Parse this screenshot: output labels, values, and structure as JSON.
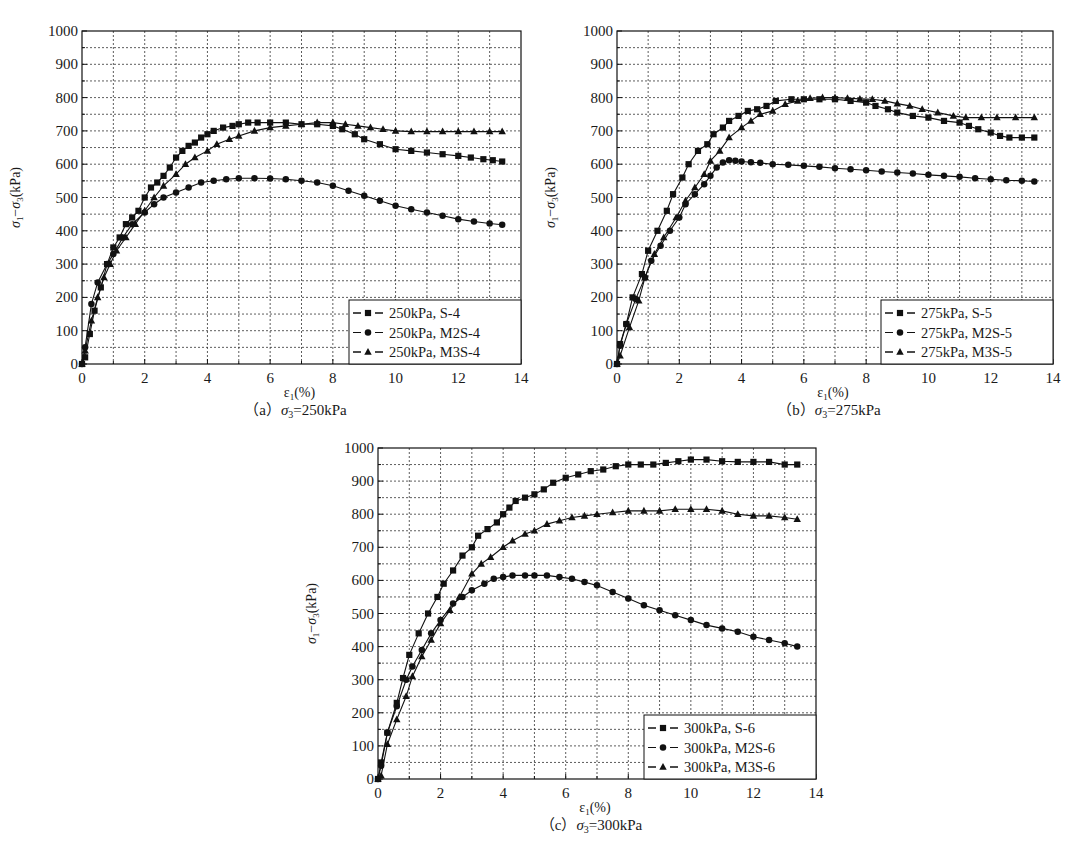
{
  "chart_data": [
    {
      "id": "a",
      "type": "line",
      "caption": "(a) σ3=250kPa",
      "caption_prefix": "（a）",
      "caption_sigma": "σ",
      "caption_sub": "3",
      "caption_rest": "=250kPa",
      "xlabel": "ε1(%)",
      "ylabel": "σ1−σ3 (kPa)",
      "xlim": [
        0,
        14
      ],
      "ylim": [
        0,
        1000
      ],
      "xticks": [
        0,
        2,
        4,
        6,
        8,
        10,
        12,
        14
      ],
      "yticks": [
        0,
        100,
        200,
        300,
        400,
        500,
        600,
        700,
        800,
        900,
        1000
      ],
      "grid": true,
      "legend_position": "lower right",
      "series": [
        {
          "name": "250kPa, S-4",
          "marker": "square",
          "x": [
            0,
            0.1,
            0.25,
            0.4,
            0.6,
            0.8,
            1.0,
            1.2,
            1.4,
            1.6,
            1.8,
            2.0,
            2.2,
            2.4,
            2.6,
            2.8,
            3.0,
            3.2,
            3.4,
            3.6,
            3.8,
            4.0,
            4.2,
            4.5,
            4.8,
            5.0,
            5.3,
            5.6,
            6.0,
            6.5,
            7.0,
            7.5,
            8.0,
            8.3,
            8.7,
            9.0,
            9.5,
            10.0,
            10.5,
            11.0,
            11.5,
            12.0,
            12.4,
            12.8,
            13.1,
            13.4
          ],
          "y": [
            0,
            20,
            90,
            160,
            230,
            300,
            350,
            380,
            420,
            440,
            460,
            500,
            530,
            545,
            565,
            590,
            620,
            640,
            655,
            665,
            680,
            690,
            700,
            710,
            715,
            720,
            725,
            725,
            725,
            725,
            720,
            720,
            715,
            705,
            690,
            675,
            660,
            645,
            640,
            635,
            630,
            625,
            620,
            615,
            612,
            608
          ]
        },
        {
          "name": "250kPa, M2S-4",
          "marker": "circle",
          "x": [
            0,
            0.1,
            0.3,
            0.5,
            0.8,
            1.0,
            1.3,
            1.6,
            2.0,
            2.3,
            2.6,
            3.0,
            3.4,
            3.8,
            4.2,
            4.6,
            5.0,
            5.5,
            6.0,
            6.5,
            7.0,
            7.5,
            8.0,
            8.5,
            9.0,
            9.5,
            10.0,
            10.5,
            11.0,
            11.5,
            12.0,
            12.5,
            13.0,
            13.4
          ],
          "y": [
            0,
            50,
            180,
            245,
            300,
            330,
            380,
            420,
            455,
            480,
            500,
            515,
            530,
            545,
            550,
            555,
            558,
            558,
            557,
            555,
            550,
            545,
            535,
            520,
            505,
            490,
            475,
            465,
            455,
            445,
            435,
            428,
            422,
            418
          ]
        },
        {
          "name": "250kPa, M3S-4",
          "marker": "triangle",
          "x": [
            0,
            0.1,
            0.3,
            0.5,
            0.7,
            0.9,
            1.1,
            1.4,
            1.7,
            2.0,
            2.3,
            2.6,
            3.0,
            3.3,
            3.6,
            4.0,
            4.3,
            4.7,
            5.0,
            5.5,
            6.0,
            6.5,
            7.0,
            7.5,
            8.0,
            8.4,
            8.8,
            9.2,
            9.6,
            10.0,
            10.5,
            11.0,
            11.5,
            12.0,
            12.5,
            13.0,
            13.4
          ],
          "y": [
            0,
            40,
            130,
            200,
            260,
            300,
            340,
            380,
            420,
            460,
            500,
            535,
            570,
            600,
            620,
            640,
            660,
            675,
            685,
            700,
            710,
            715,
            720,
            725,
            725,
            720,
            715,
            710,
            705,
            700,
            698,
            698,
            698,
            698,
            698,
            698,
            698
          ]
        }
      ]
    },
    {
      "id": "b",
      "type": "line",
      "caption": "(b) σ3=275kPa",
      "caption_prefix": "（b）",
      "caption_sigma": "σ",
      "caption_sub": "3",
      "caption_rest": "=275kPa",
      "xlabel": "ε1(%)",
      "ylabel": "σ1−σ3 (kPa)",
      "xlim": [
        0,
        14
      ],
      "ylim": [
        0,
        1000
      ],
      "xticks": [
        0,
        2,
        4,
        6,
        8,
        10,
        12,
        14
      ],
      "yticks": [
        0,
        100,
        200,
        300,
        400,
        500,
        600,
        700,
        800,
        900,
        1000
      ],
      "grid": true,
      "legend_position": "lower right",
      "series": [
        {
          "name": "275kPa, S-5",
          "marker": "square",
          "x": [
            0,
            0.1,
            0.3,
            0.5,
            0.8,
            1.0,
            1.3,
            1.6,
            1.8,
            2.1,
            2.3,
            2.6,
            2.9,
            3.1,
            3.4,
            3.6,
            3.9,
            4.2,
            4.5,
            4.8,
            5.1,
            5.6,
            6.0,
            6.5,
            7.0,
            7.5,
            8.0,
            8.3,
            8.7,
            9.0,
            9.5,
            10.0,
            10.5,
            11.0,
            11.3,
            11.6,
            12.0,
            12.3,
            12.6,
            13.0,
            13.4
          ],
          "y": [
            0,
            60,
            120,
            200,
            270,
            340,
            400,
            460,
            510,
            560,
            600,
            640,
            660,
            690,
            710,
            730,
            745,
            760,
            765,
            775,
            790,
            795,
            795,
            795,
            795,
            790,
            785,
            775,
            765,
            755,
            745,
            740,
            730,
            725,
            715,
            705,
            695,
            685,
            680,
            680,
            680
          ]
        },
        {
          "name": "275kPa, M2S-5",
          "marker": "circle",
          "x": [
            0,
            0.1,
            0.3,
            0.6,
            0.9,
            1.1,
            1.4,
            1.7,
            2.0,
            2.2,
            2.5,
            2.8,
            3.0,
            3.2,
            3.4,
            3.6,
            3.8,
            4.0,
            4.3,
            4.6,
            5.0,
            5.5,
            6.0,
            6.5,
            7.0,
            7.5,
            8.0,
            8.5,
            9.0,
            9.5,
            10.0,
            10.5,
            11.0,
            11.5,
            12.0,
            12.5,
            13.0,
            13.4
          ],
          "y": [
            0,
            55,
            120,
            195,
            260,
            310,
            355,
            400,
            440,
            480,
            510,
            540,
            565,
            590,
            605,
            612,
            610,
            608,
            606,
            604,
            600,
            598,
            595,
            592,
            588,
            585,
            582,
            578,
            575,
            572,
            568,
            565,
            562,
            558,
            555,
            552,
            550,
            548
          ]
        },
        {
          "name": "275kPa, M3S-5",
          "marker": "triangle",
          "x": [
            0,
            0.1,
            0.4,
            0.7,
            0.9,
            1.2,
            1.5,
            1.9,
            2.2,
            2.5,
            2.8,
            3.0,
            3.3,
            3.6,
            4.0,
            4.3,
            4.6,
            5.0,
            5.4,
            5.8,
            6.2,
            6.6,
            7.0,
            7.4,
            7.8,
            8.2,
            8.6,
            9.0,
            9.4,
            9.8,
            10.3,
            10.8,
            11.2,
            11.7,
            12.2,
            12.8,
            13.4
          ],
          "y": [
            0,
            25,
            110,
            190,
            260,
            330,
            380,
            440,
            490,
            530,
            570,
            610,
            640,
            680,
            710,
            730,
            750,
            760,
            780,
            790,
            798,
            800,
            800,
            798,
            796,
            795,
            790,
            782,
            775,
            765,
            755,
            745,
            740,
            740,
            740,
            740,
            740
          ]
        }
      ]
    },
    {
      "id": "c",
      "type": "line",
      "caption": "(c) σ3=300kPa",
      "caption_prefix": "（c）",
      "caption_sigma": "σ",
      "caption_sub": "3",
      "caption_rest": "=300kPa",
      "xlabel": "ε1(%)",
      "ylabel": "σ1−σ3 (kPa)",
      "xlim": [
        0,
        14
      ],
      "ylim": [
        0,
        1000
      ],
      "xticks": [
        0,
        2,
        4,
        6,
        8,
        10,
        12,
        14
      ],
      "yticks": [
        0,
        100,
        200,
        300,
        400,
        500,
        600,
        700,
        800,
        900,
        1000
      ],
      "grid": true,
      "legend_position": "lower right",
      "series": [
        {
          "name": "300kPa, S-6",
          "marker": "square",
          "x": [
            0,
            0.1,
            0.3,
            0.6,
            0.8,
            1.0,
            1.3,
            1.6,
            1.9,
            2.1,
            2.4,
            2.7,
            3.0,
            3.2,
            3.5,
            3.8,
            4.0,
            4.2,
            4.4,
            4.7,
            5.0,
            5.3,
            5.6,
            6.0,
            6.4,
            6.8,
            7.2,
            7.6,
            8.0,
            8.4,
            8.8,
            9.2,
            9.6,
            10.0,
            10.5,
            11.0,
            11.5,
            12.0,
            12.5,
            13.0,
            13.4
          ],
          "y": [
            0,
            50,
            140,
            230,
            305,
            375,
            440,
            500,
            550,
            590,
            630,
            675,
            700,
            735,
            755,
            775,
            800,
            820,
            840,
            850,
            860,
            875,
            895,
            910,
            920,
            930,
            935,
            945,
            950,
            950,
            950,
            955,
            960,
            965,
            965,
            960,
            958,
            958,
            958,
            950,
            950
          ]
        },
        {
          "name": "300kPa, M2S-6",
          "marker": "circle",
          "x": [
            0,
            0.1,
            0.3,
            0.6,
            0.9,
            1.1,
            1.4,
            1.7,
            2.0,
            2.4,
            2.7,
            3.0,
            3.4,
            3.7,
            4.0,
            4.3,
            4.7,
            5.0,
            5.4,
            5.8,
            6.2,
            6.6,
            7.0,
            7.5,
            8.0,
            8.5,
            9.0,
            9.5,
            10.0,
            10.5,
            11.0,
            11.5,
            12.0,
            12.5,
            13.0,
            13.4
          ],
          "y": [
            0,
            40,
            140,
            220,
            300,
            340,
            390,
            440,
            480,
            530,
            550,
            570,
            590,
            605,
            610,
            615,
            615,
            615,
            615,
            610,
            605,
            595,
            585,
            565,
            545,
            525,
            510,
            495,
            480,
            465,
            455,
            445,
            430,
            420,
            410,
            400
          ]
        },
        {
          "name": "300kPa, M3S-6",
          "marker": "triangle",
          "x": [
            0,
            0.1,
            0.3,
            0.6,
            0.9,
            1.1,
            1.4,
            1.7,
            2.0,
            2.3,
            2.6,
            3.0,
            3.3,
            3.6,
            4.0,
            4.3,
            4.7,
            5.0,
            5.4,
            5.8,
            6.2,
            6.6,
            7.0,
            7.5,
            8.0,
            8.5,
            9.0,
            9.5,
            10.0,
            10.5,
            11.0,
            11.5,
            12.0,
            12.5,
            13.0,
            13.4
          ],
          "y": [
            0,
            10,
            105,
            180,
            250,
            310,
            370,
            420,
            470,
            510,
            550,
            620,
            650,
            670,
            700,
            720,
            740,
            750,
            770,
            780,
            790,
            795,
            800,
            805,
            810,
            810,
            810,
            815,
            815,
            815,
            810,
            800,
            795,
            795,
            790,
            785
          ]
        }
      ]
    }
  ],
  "panels": {
    "a": {
      "left": 82,
      "top": 31,
      "right": 521,
      "bottom": 364
    },
    "b": {
      "left": 617,
      "top": 31,
      "right": 1053,
      "bottom": 364
    },
    "c": {
      "left": 378,
      "top": 448,
      "right": 816,
      "bottom": 779
    }
  }
}
